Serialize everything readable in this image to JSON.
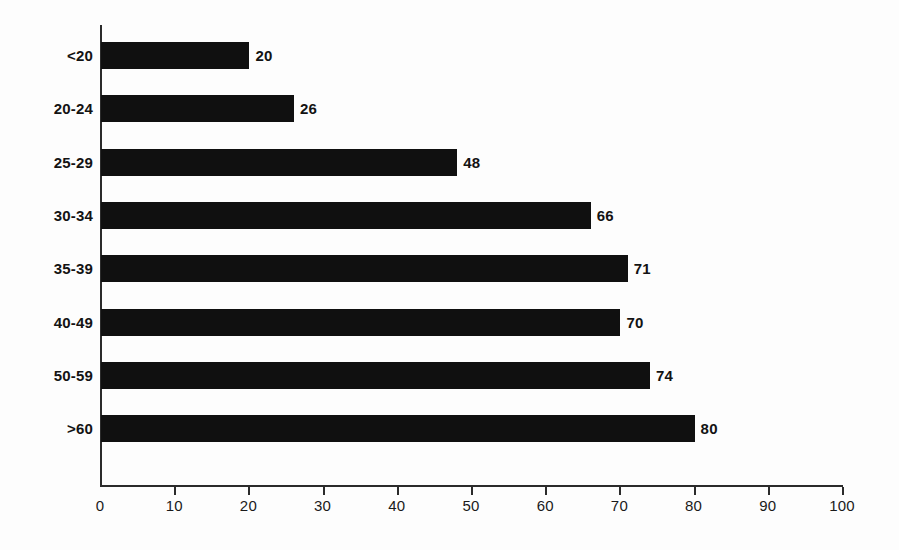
{
  "chart_data": {
    "type": "bar",
    "orientation": "horizontal",
    "title": "",
    "subtitle": "",
    "xlabel": "",
    "ylabel": "",
    "categories": [
      "<20",
      "20-24",
      "25-29",
      "30-34",
      "35-39",
      "40-49",
      "50-59",
      ">60"
    ],
    "values": [
      20,
      26,
      48,
      66,
      71,
      70,
      74,
      80
    ],
    "value_labels": [
      "20",
      "26",
      "48",
      "66",
      "71",
      "70",
      "74",
      "80"
    ],
    "xlim": [
      0,
      100
    ],
    "ylim": null,
    "x_ticks": [
      0,
      10,
      20,
      30,
      40,
      50,
      60,
      70,
      80,
      90,
      100
    ],
    "x_tick_labels": [
      "0",
      "10",
      "20",
      "30",
      "40",
      "50",
      "60",
      "70",
      "80",
      "90",
      "100"
    ],
    "grid": false,
    "legend": null,
    "legend_position": "none",
    "series": [
      {
        "name": "",
        "values": [
          20,
          26,
          48,
          66,
          71,
          70,
          74,
          80
        ]
      }
    ],
    "colors": {
      "bar": "#101010",
      "axis": "#2b2b2b",
      "text": "#131313",
      "background": "#fdfdfd"
    }
  }
}
